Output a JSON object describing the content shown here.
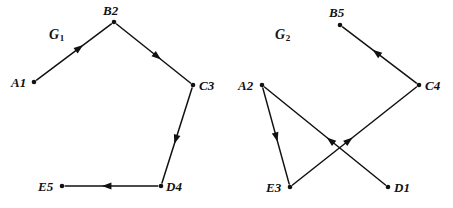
{
  "figure": {
    "width": 453,
    "height": 208,
    "background": "#ffffff",
    "ink_color": "#111111"
  },
  "graphs": [
    {
      "id": "G1",
      "caption_base": "G",
      "caption_sub": "1",
      "caption_pos": {
        "x": 49,
        "y": 28
      },
      "nodes": [
        {
          "id": "A1",
          "label": "A1",
          "x": 34,
          "y": 82,
          "label_x": 11,
          "label_y": 76
        },
        {
          "id": "B2",
          "label": "B2",
          "x": 114,
          "y": 22,
          "label_x": 103,
          "label_y": 4
        },
        {
          "id": "C3",
          "label": "C3",
          "x": 193,
          "y": 85,
          "label_x": 199,
          "label_y": 79
        },
        {
          "id": "D4",
          "label": "D4",
          "x": 161,
          "y": 186,
          "label_x": 166,
          "label_y": 180
        },
        {
          "id": "E5",
          "label": "E5",
          "x": 62,
          "y": 186,
          "label_x": 38,
          "label_y": 180
        }
      ],
      "edges": [
        {
          "from": "A1",
          "to": "B2",
          "arrow_at": 0.58
        },
        {
          "from": "B2",
          "to": "C3",
          "arrow_at": 0.56
        },
        {
          "from": "C3",
          "to": "D4",
          "arrow_at": 0.55
        },
        {
          "from": "D4",
          "to": "E5",
          "arrow_at": 0.56
        }
      ]
    },
    {
      "id": "G2",
      "caption_base": "G",
      "caption_sub": "2",
      "caption_pos": {
        "x": 275,
        "y": 28
      },
      "nodes": [
        {
          "id": "B5",
          "label": "B5",
          "x": 340,
          "y": 25,
          "label_x": 329,
          "label_y": 6
        },
        {
          "id": "C4",
          "label": "C4",
          "x": 419,
          "y": 85,
          "label_x": 425,
          "label_y": 79
        },
        {
          "id": "A2",
          "label": "A2",
          "x": 262,
          "y": 85,
          "label_x": 238,
          "label_y": 79
        },
        {
          "id": "E3",
          "label": "E3",
          "x": 290,
          "y": 187,
          "label_x": 266,
          "label_y": 181
        },
        {
          "id": "D1",
          "label": "D1",
          "x": 388,
          "y": 187,
          "label_x": 394,
          "label_y": 181
        }
      ],
      "edges": [
        {
          "from": "C4",
          "to": "B5",
          "arrow_at": 0.55
        },
        {
          "from": "A2",
          "to": "E3",
          "arrow_at": 0.52
        },
        {
          "from": "E3",
          "to": "C4",
          "arrow_at": 0.46
        },
        {
          "from": "D1",
          "to": "A2",
          "arrow_at": 0.46
        }
      ]
    }
  ]
}
